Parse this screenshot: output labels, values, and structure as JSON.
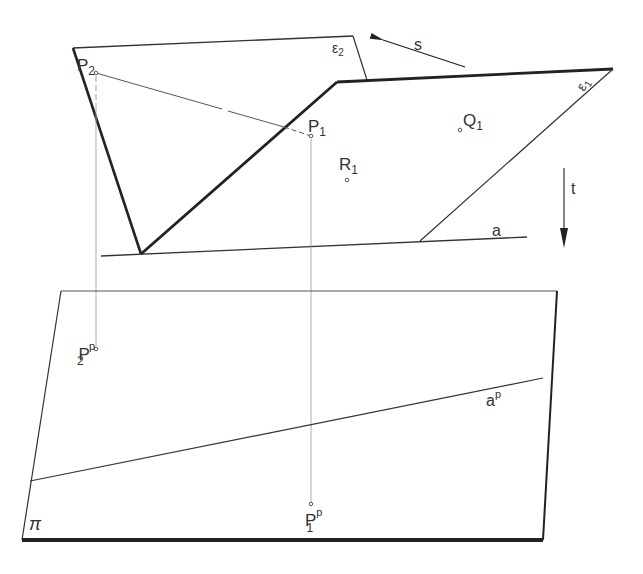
{
  "diagram": {
    "planes": {
      "epsilon2": {
        "label": "ε",
        "sub": "2"
      },
      "epsilon1": {
        "label": "ε",
        "sub": "1"
      },
      "pi": {
        "label": "π"
      }
    },
    "points": {
      "P2": {
        "label": "P",
        "sub": "2"
      },
      "P1": {
        "label": "P",
        "sub": "1"
      },
      "R1": {
        "label": "R",
        "sub": "1"
      },
      "Q1": {
        "label": "Q",
        "sub": "1"
      },
      "P2p": {
        "label": "P",
        "sub": "2",
        "sup": "p"
      },
      "P1p": {
        "label": "P",
        "sub": "1",
        "sup": "p"
      }
    },
    "lines": {
      "a": {
        "label": "a"
      },
      "ap": {
        "label": "a",
        "sup": "p"
      }
    },
    "vectors": {
      "s": {
        "label": "s"
      },
      "t": {
        "label": "t"
      }
    }
  },
  "colors": {
    "stroke": "#222222",
    "thin": "#555555",
    "projector": "#888888"
  }
}
